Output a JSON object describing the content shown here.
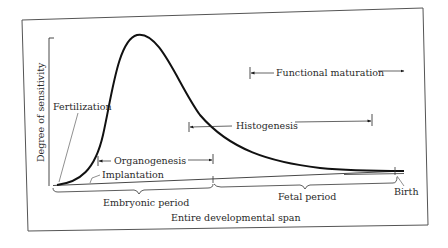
{
  "diagram": {
    "y_axis_label": "Degree of sensitivity",
    "labels": {
      "fertilization": "Fertilization",
      "implantation": "Implantation",
      "organogenesis": "Organogenesis",
      "histogenesis": "Histogenesis",
      "functional_maturation": "Functional maturation",
      "embryonic_period": "Embryonic period",
      "fetal_period": "Fetal period",
      "birth": "Birth",
      "entire_span": "Entire developmental span"
    },
    "colors": {
      "ink": "#1a1a1a",
      "frame": "#555555",
      "background": "#ffffff"
    }
  }
}
